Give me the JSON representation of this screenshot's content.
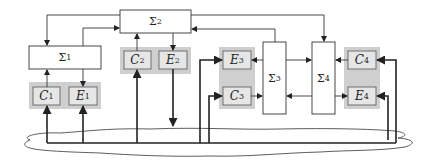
{
  "diagram": {
    "type": "block-diagram",
    "blocks": [
      {
        "id": "sigma1",
        "label": "Σ",
        "sub": "1"
      },
      {
        "id": "sigma2",
        "label": "Σ",
        "sub": "2"
      },
      {
        "id": "sigma3",
        "label": "Σ",
        "sub": "3"
      },
      {
        "id": "sigma4",
        "label": "Σ",
        "sub": "4"
      },
      {
        "id": "c1",
        "label": "C",
        "sub": "1"
      },
      {
        "id": "e1",
        "label": "E",
        "sub": "1"
      },
      {
        "id": "c2",
        "label": "C",
        "sub": "2"
      },
      {
        "id": "e2",
        "label": "E",
        "sub": "2"
      },
      {
        "id": "e3",
        "label": "E",
        "sub": "3"
      },
      {
        "id": "c3",
        "label": "C",
        "sub": "3"
      },
      {
        "id": "c4",
        "label": "C",
        "sub": "4"
      },
      {
        "id": "e4",
        "label": "E",
        "sub": "4"
      }
    ],
    "edges": [
      [
        "sigma2",
        "sigma1"
      ],
      [
        "sigma1",
        "sigma2"
      ],
      [
        "c1",
        "sigma1"
      ],
      [
        "sigma1",
        "e1"
      ],
      [
        "c2",
        "sigma2"
      ],
      [
        "sigma2",
        "e2"
      ],
      [
        "sigma3",
        "sigma2"
      ],
      [
        "sigma2",
        "sigma4"
      ],
      [
        "sigma3",
        "e3"
      ],
      [
        "c3",
        "sigma3"
      ],
      [
        "sigma3",
        "sigma4"
      ],
      [
        "sigma4",
        "sigma3"
      ],
      [
        "c4",
        "sigma4"
      ],
      [
        "sigma4",
        "e4"
      ],
      [
        "network",
        "c1"
      ],
      [
        "network",
        "e1"
      ],
      [
        "network",
        "c2"
      ],
      [
        "e2",
        "network"
      ],
      [
        "network",
        "e3"
      ],
      [
        "network",
        "c3"
      ],
      [
        "network",
        "c4"
      ],
      [
        "network",
        "e4"
      ]
    ],
    "network": "cloud"
  }
}
